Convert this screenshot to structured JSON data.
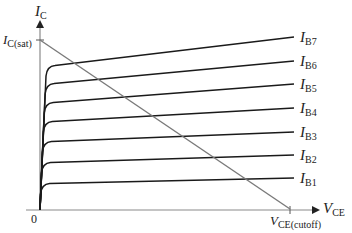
{
  "figure": {
    "y_axis": {
      "symbol": "I",
      "subscript": "C"
    },
    "x_axis": {
      "symbol": "V",
      "subscript": "CE"
    },
    "origin_label": "0",
    "load_line": {
      "top_label": {
        "symbol": "I",
        "subscript": "C(sat)"
      },
      "bottom_label": {
        "symbol": "V",
        "subscript": "CE(cutoff)"
      },
      "color": "#7a7a7a"
    },
    "curve_color": "#1a1a1a",
    "axis_color": "#8a8a8a",
    "curves": [
      {
        "symbol": "I",
        "subscript": "B7",
        "knee_y": 66,
        "end_y": 37
      },
      {
        "symbol": "I",
        "subscript": "B6",
        "knee_y": 84,
        "end_y": 61
      },
      {
        "symbol": "I",
        "subscript": "B5",
        "knee_y": 103,
        "end_y": 84
      },
      {
        "symbol": "I",
        "subscript": "B4",
        "knee_y": 122,
        "end_y": 108
      },
      {
        "symbol": "I",
        "subscript": "B3",
        "knee_y": 142,
        "end_y": 132
      },
      {
        "symbol": "I",
        "subscript": "B2",
        "knee_y": 163,
        "end_y": 155
      },
      {
        "symbol": "I",
        "subscript": "B1",
        "knee_y": 184,
        "end_y": 178
      }
    ]
  }
}
